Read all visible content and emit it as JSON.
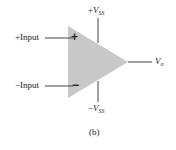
{
  "diagram": {
    "type": "op-amp symbol",
    "inputs": {
      "plus_label": "+Input",
      "minus_label": "−Input",
      "plus_sign": "+",
      "minus_sign": "−"
    },
    "supply": {
      "positive": {
        "prefix": "+",
        "symbol": "V",
        "sub": "SS"
      },
      "negative": {
        "prefix": "−",
        "symbol": "V",
        "sub": "SS"
      }
    },
    "output": {
      "symbol": "V",
      "sub": "o"
    },
    "caption": "(b)",
    "colors": {
      "triangle": "#c8c8c8",
      "lines": "#333333",
      "text": "#222222"
    }
  }
}
